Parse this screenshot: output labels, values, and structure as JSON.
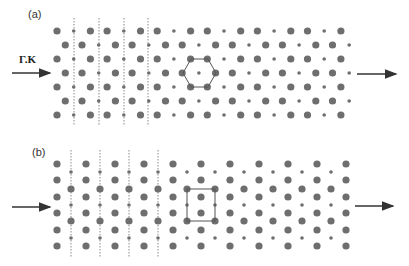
{
  "figure": {
    "panels": [
      {
        "id": "a",
        "label": "(a)",
        "lattice": "hexagonal-honeycomb",
        "direction_label": "Γ.K",
        "rows_y": [
          31,
          45,
          59,
          73,
          87,
          101,
          115
        ],
        "row_start_x": [
          57,
          65.3,
          57,
          65.3,
          57,
          65.3,
          57
        ],
        "row_phase": [
          0,
          1,
          0,
          1,
          0,
          1,
          0
        ],
        "step_x": 16.7,
        "sites_per_row": [
          18,
          18,
          18,
          18,
          18,
          18,
          18
        ],
        "pattern": [
          "L",
          "s",
          "L"
        ],
        "dashed_lines_x": [
          74,
          99,
          124,
          148
        ],
        "dashed_y_range": [
          18,
          126
        ],
        "cell_outline": {
          "shape": "hexagon",
          "points": [
            [
              191,
              59
            ],
            [
              208,
              59
            ],
            [
              216,
              73
            ],
            [
              208,
              87
            ],
            [
              191,
              87
            ],
            [
              183,
              73
            ]
          ]
        },
        "arrow_in": {
          "x1": 12,
          "x2": 50,
          "y": 73
        },
        "arrow_out": {
          "x1": 357,
          "x2": 396,
          "y": 74
        }
      },
      {
        "id": "b",
        "label": "(b)",
        "lattice": "rectangular",
        "major_cols_x": [
          57,
          86,
          115,
          144,
          173,
          201,
          230,
          259,
          288,
          317,
          346
        ],
        "major_rows_y": [
          164,
          180,
          197,
          213,
          230,
          246
        ],
        "minor_cols_x": [
          71,
          100,
          129,
          158,
          187,
          215,
          244,
          273,
          302,
          331
        ],
        "minor_small_y": [
          172,
          205,
          238
        ],
        "minor_large_y": [
          189,
          221
        ],
        "dashed_lines_x": [
          71,
          100,
          129,
          158
        ],
        "dashed_y_range": [
          150,
          258
        ],
        "cell_outline": {
          "shape": "rectangle",
          "x": 187,
          "y": 189,
          "w": 28,
          "h": 32
        },
        "arrow_in": {
          "x1": 12,
          "x2": 50,
          "y": 207
        },
        "arrow_out": {
          "x1": 355,
          "x2": 393,
          "y": 206
        }
      }
    ],
    "colors": {
      "dot": "#6e6e6e",
      "line": "#555555",
      "arrow": "#333333",
      "dashed": "#888888"
    }
  }
}
